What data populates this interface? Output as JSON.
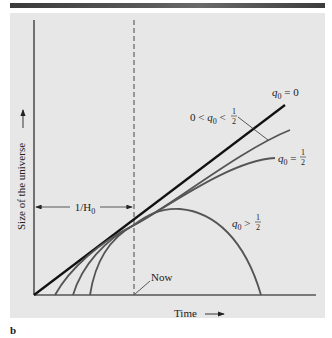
{
  "figure": {
    "panel_label": "b",
    "axes": {
      "x_label": "Time",
      "y_label": "Size of the universe",
      "arrow": "→"
    },
    "annotations": {
      "hubble_time": {
        "prefix": "1/H",
        "sub": "0"
      },
      "now": "Now"
    },
    "curves": [
      {
        "id": "q0-zero",
        "label_pre": "q",
        "label_sub": "0",
        "label_rel": " = ",
        "label_val": "0",
        "description": "linear expansion (empty universe)",
        "color": "#1a1a1a"
      },
      {
        "id": "q0-between",
        "label_left": "0 < ",
        "label_pre": "q",
        "label_sub": "0",
        "label_rel": " < ",
        "label_num": "1",
        "label_den": "2",
        "description": "open universe, expands forever",
        "color": "#555555"
      },
      {
        "id": "q0-half",
        "label_pre": "q",
        "label_sub": "0",
        "label_rel": " = ",
        "label_num": "1",
        "label_den": "2",
        "description": "critical density",
        "color": "#555555"
      },
      {
        "id": "q0-greater",
        "label_pre": "q",
        "label_sub": "0",
        "label_rel": " > ",
        "label_num": "1",
        "label_den": "2",
        "description": "closed universe, recollapses",
        "color": "#555555"
      }
    ]
  }
}
